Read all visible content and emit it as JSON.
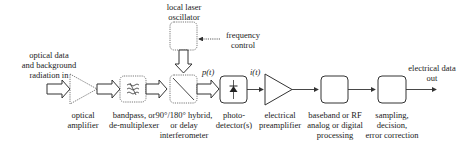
{
  "diagram": {
    "type": "block-diagram",
    "title": "",
    "input_label": [
      "optical data",
      "and background",
      "radiation in"
    ],
    "output_label": [
      "electrical data",
      "out"
    ],
    "oscillator_label": [
      "local laser",
      "oscillator"
    ],
    "frequency_control_label": [
      "frequency",
      "control"
    ],
    "signals": {
      "p": "p(t)",
      "i": "i(t)"
    },
    "blocks": [
      {
        "id": "optical-amplifier",
        "label": [
          "optical",
          "amplifier"
        ],
        "shape": "triangle-dotted"
      },
      {
        "id": "bandpass",
        "label": [
          "bandpass, or",
          "de-multiplexer"
        ],
        "shape": "box-dotted",
        "icon": "filter-waves"
      },
      {
        "id": "hybrid",
        "label": [
          "90°/180° hybrid,",
          "or delay",
          "interferometer"
        ],
        "shape": "box-dotted",
        "icon": "beam-splitter"
      },
      {
        "id": "photodetector",
        "label": [
          "photo-",
          "detector(s)"
        ],
        "shape": "box-solid",
        "icon": "diode"
      },
      {
        "id": "preamplifier",
        "label": [
          "electrical",
          "preamplifier"
        ],
        "shape": "triangle-solid"
      },
      {
        "id": "processing",
        "label": [
          "baseband or RF",
          "analog or digital",
          "processing"
        ],
        "shape": "box-solid"
      },
      {
        "id": "sampling",
        "label": [
          "sampling,",
          "decision,",
          "error correction"
        ],
        "shape": "box-solid"
      }
    ],
    "colors": {
      "line": "#333333",
      "background": "#ffffff"
    }
  }
}
